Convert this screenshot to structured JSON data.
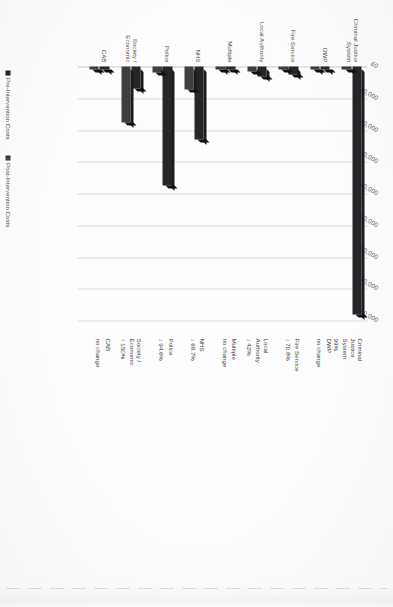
{
  "chart_data": {
    "type": "bar",
    "title": "",
    "orientation": "vertical",
    "xlabel": "",
    "ylabel": "",
    "ylim": [
      0,
      80000
    ],
    "grid": true,
    "legend_position": "bottom-left",
    "tick_labels": [
      "£0",
      "£10,000",
      "£20,000",
      "£30,000",
      "£40,000",
      "£50,000",
      "£60,000",
      "£70,000",
      "£80,000"
    ],
    "tick_values": [
      0,
      10000,
      20000,
      30000,
      40000,
      50000,
      60000,
      70000,
      80000
    ],
    "categories": [
      "Criminal Justice System",
      "DWP",
      "Fire Service",
      "Local Authority",
      "Multiple",
      "NHS",
      "Police",
      "Society / Economic",
      "CAB"
    ],
    "series": [
      {
        "name": "Pre-Intervention Costs",
        "color": "#262628",
        "values": [
          78000,
          1100,
          2400,
          3000,
          250,
          23000,
          37500,
          7000,
          300
        ]
      },
      {
        "name": "Post-Intervention Costs",
        "color": "#3e3e41",
        "values": [
          800,
          1100,
          700,
          1700,
          250,
          7200,
          2000,
          17500,
          300
        ]
      }
    ],
    "annotations": [
      {
        "name": "Criminal\nJustice\nSystem",
        "delta": "99%",
        "arrow": ""
      },
      {
        "name": "DWP",
        "delta": "no change",
        "arrow": ""
      },
      {
        "name": "Fire Service",
        "delta": "70.8%",
        "arrow": "↓"
      },
      {
        "name": "Local\nAuthority",
        "delta": "42%",
        "arrow": "↓"
      },
      {
        "name": "Multiple",
        "delta": "no change",
        "arrow": ""
      },
      {
        "name": "NHS",
        "delta": "68.7%",
        "arrow": "↓"
      },
      {
        "name": "Police",
        "delta": "94.6%",
        "arrow": "↓"
      },
      {
        "name": "Society /\nEconomic",
        "delta": "150%",
        "arrow": "↑"
      },
      {
        "name": "CAB",
        "delta": "no change",
        "arrow": ""
      }
    ]
  },
  "legend": {
    "items": [
      {
        "label": "Pre-Intervention Costs"
      },
      {
        "label": "Post-Intervention Costs"
      }
    ]
  }
}
